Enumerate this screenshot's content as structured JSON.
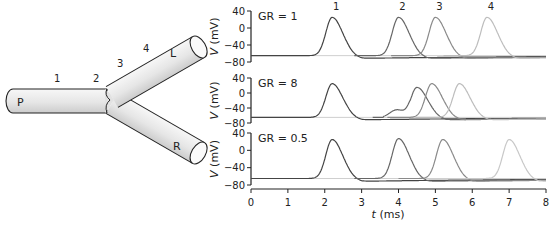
{
  "diagram": {
    "segments": {
      "parent_label": "P",
      "left_label": "L",
      "right_label": "R"
    },
    "recording_sites": [
      "1",
      "2",
      "3",
      "4"
    ],
    "cylinder_fill_light": "#f4f4f4",
    "cylinder_fill_dark": "#cfcfcf",
    "outline_color": "#222222"
  },
  "chart_data": [
    {
      "type": "line",
      "panel_label": "GR = 1",
      "xlabel": "t (ms)",
      "ylabel": "V (mV)",
      "xlim": [
        0,
        8
      ],
      "ylim": [
        -80,
        40
      ],
      "xticks": [
        0,
        1,
        2,
        3,
        4,
        5,
        6,
        7,
        8
      ],
      "yticks": [
        40,
        0,
        -40,
        -80
      ],
      "resting_mV": -65,
      "series": [
        {
          "name": "1",
          "peak_t": 2.2,
          "peak_v": 25,
          "color": "#444444"
        },
        {
          "name": "2",
          "peak_t": 4.0,
          "peak_v": 25,
          "color": "#666666"
        },
        {
          "name": "3",
          "peak_t": 5.0,
          "peak_v": 25,
          "color": "#8a8a8a"
        },
        {
          "name": "4",
          "peak_t": 6.4,
          "peak_v": 25,
          "color": "#bdbdbd"
        }
      ],
      "show_peak_labels": true
    },
    {
      "type": "line",
      "panel_label": "GR = 8",
      "xlabel": "t (ms)",
      "ylabel": "V (mV)",
      "xlim": [
        0,
        8
      ],
      "ylim": [
        -80,
        40
      ],
      "xticks": [
        0,
        1,
        2,
        3,
        4,
        5,
        6,
        7,
        8
      ],
      "yticks": [
        40,
        0,
        -40,
        -80
      ],
      "resting_mV": -65,
      "series": [
        {
          "name": "1",
          "peak_t": 2.2,
          "peak_v": 25,
          "color": "#444444"
        },
        {
          "name": "2",
          "peak_t": 4.5,
          "peak_v": 15,
          "color": "#666666",
          "shoulder": true
        },
        {
          "name": "3",
          "peak_t": 4.9,
          "peak_v": 25,
          "color": "#8a8a8a"
        },
        {
          "name": "4",
          "peak_t": 5.65,
          "peak_v": 25,
          "color": "#bdbdbd"
        }
      ],
      "show_peak_labels": false
    },
    {
      "type": "line",
      "panel_label": "GR = 0.5",
      "xlabel": "t (ms)",
      "ylabel": "V (mV)",
      "xlim": [
        0,
        8
      ],
      "ylim": [
        -80,
        40
      ],
      "xticks": [
        0,
        1,
        2,
        3,
        4,
        5,
        6,
        7,
        8
      ],
      "yticks": [
        40,
        0,
        -40,
        -80
      ],
      "resting_mV": -65,
      "series": [
        {
          "name": "1",
          "peak_t": 2.2,
          "peak_v": 25,
          "color": "#444444"
        },
        {
          "name": "2",
          "peak_t": 4.0,
          "peak_v": 27,
          "color": "#666666"
        },
        {
          "name": "3",
          "peak_t": 5.2,
          "peak_v": 25,
          "color": "#8a8a8a"
        },
        {
          "name": "4",
          "peak_t": 7.0,
          "peak_v": 25,
          "color": "#c8c8c8"
        }
      ],
      "show_peak_labels": false
    }
  ],
  "axis_labels": {
    "x": "t (ms)",
    "y": "V (mV)"
  }
}
